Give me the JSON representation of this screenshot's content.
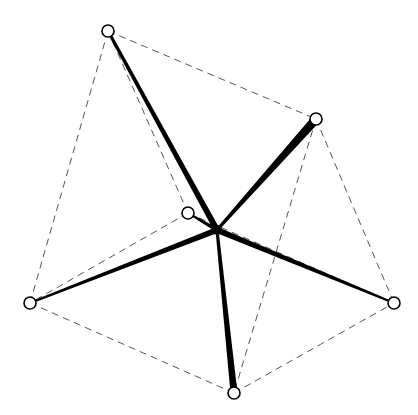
{
  "diagram": {
    "type": "star-graph-with-dashed-outline",
    "colors": {
      "background": "#ffffff",
      "solid": "#000000",
      "dashed": "#555555"
    },
    "hub": {
      "id": "center",
      "x": 217,
      "y": 230,
      "r": 5
    },
    "nodes": [
      {
        "id": "top-left",
        "x": 108,
        "y": 31
      },
      {
        "id": "upper-right",
        "x": 316,
        "y": 119
      },
      {
        "id": "inner",
        "x": 188,
        "y": 213
      },
      {
        "id": "left",
        "x": 30,
        "y": 303
      },
      {
        "id": "right",
        "x": 394,
        "y": 303
      },
      {
        "id": "bottom",
        "x": 234,
        "y": 393
      }
    ],
    "spokes": [
      {
        "to": "top-left",
        "hub_width": 6,
        "end_width": 3
      },
      {
        "to": "upper-right",
        "hub_width": 3,
        "end_width": 9
      },
      {
        "to": "inner",
        "hub_width": 4,
        "end_width": 2
      },
      {
        "to": "left",
        "hub_width": 6,
        "end_width": 2
      },
      {
        "to": "right",
        "hub_width": 6,
        "end_width": 2
      },
      {
        "to": "bottom",
        "hub_width": 3,
        "end_width": 7
      }
    ],
    "dashed_edges": [
      [
        "top-left",
        "upper-right"
      ],
      [
        "top-left",
        "left"
      ],
      [
        "top-left",
        "inner"
      ],
      [
        "upper-right",
        "right"
      ],
      [
        "upper-right",
        "bottom"
      ],
      [
        "inner",
        "left"
      ],
      [
        "inner",
        "right"
      ],
      [
        "left",
        "bottom"
      ],
      [
        "bottom",
        "right"
      ]
    ]
  }
}
